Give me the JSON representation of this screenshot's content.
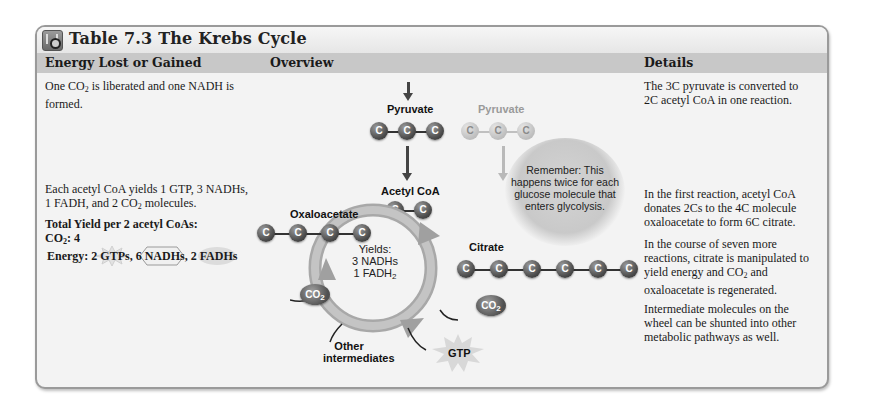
{
  "title": {
    "icon": "media-table-icon",
    "label": "Table 7.3  The Krebs Cycle"
  },
  "columns": {
    "energy": "Energy Lost or Gained",
    "overview": "Overview",
    "details": "Details"
  },
  "rows": [
    {
      "energy_text_a": "One CO",
      "energy_text_sub": "2",
      "energy_text_b": " is liberated and one NADH is formed.",
      "details": "The 3C pyruvate is converted to 2C acetyl CoA in one reaction."
    },
    {
      "energy_line1": "Each acetyl CoA yields 1 GTP, 3 NADHs,",
      "energy_line2a": "1 FADH, and 2 CO",
      "energy_line2sub": "2",
      "energy_line2b": " molecules.",
      "total_heading": "Total Yield per 2 acetyl CoAs:",
      "total_co2_a": "CO",
      "total_co2_sub": "2",
      "total_co2_b": ": 4",
      "total_energy": "Energy: 2 GTPs, 6 NADHs, 2 FADHs",
      "details_1": "In the first reaction, acetyl CoA donates 2Cs to the 4C molecule oxaloacetate to form 6C citrate.",
      "details_2a": "In the course of seven more reactions, citrate is manipulated to yield energy and CO",
      "details_2sub": "2",
      "details_2b": " and oxaloacetate is regenerated.",
      "details_3": "Intermediate molecules on the wheel can be shunted into other metabolic pathways as well."
    }
  ],
  "diagram": {
    "pyruvate_label": "Pyruvate",
    "pyruvate_faded_label": "Pyruvate",
    "atom": "C",
    "acetyl_coa_label": "Acetyl CoA",
    "oxaloacetate_label": "Oxaloacetate",
    "citrate_label": "Citrate",
    "yields_title": "Yields:",
    "yields_nadh": "3 NADHs",
    "yields_fadh_a": "1 FADH",
    "yields_fadh_sub": "2",
    "co2_a": "CO",
    "co2_sub": "2",
    "other_line1": "Other",
    "other_line2": "intermediates",
    "gtp": "GTP",
    "remember": "Remember: This happens twice for each glucose molecule that enters glycolysis."
  }
}
